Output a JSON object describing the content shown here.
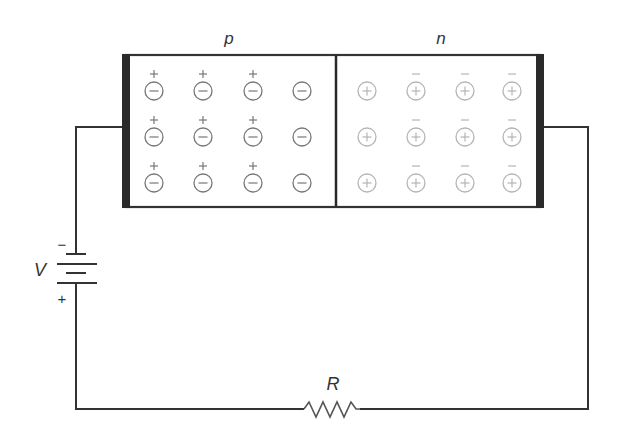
{
  "diagram": {
    "title": "",
    "labels": {
      "p_region": "p",
      "n_region": "n",
      "voltage": "V",
      "resistor": "R",
      "battery_negative": "−",
      "battery_positive": "+"
    },
    "colors": {
      "wire": "#333333",
      "contact": "#2a2a2a",
      "p_ion": "#777777",
      "n_ion": "#b5b5b5"
    },
    "p_region": {
      "ion_type": "acceptor (negative ion)",
      "ion_symbol": "−",
      "carrier_symbol": "+",
      "ion_columns_x": [
        154,
        203,
        253,
        302
      ],
      "ion_rows_y": [
        91,
        137,
        183
      ],
      "carriers_present_columns": [
        0,
        1,
        2
      ]
    },
    "n_region": {
      "ion_type": "donor (positive ion)",
      "ion_symbol": "+",
      "carrier_symbol": "−",
      "ion_columns_x": [
        367,
        416,
        465,
        512
      ],
      "ion_rows_y": [
        91,
        137,
        183
      ],
      "carriers_present_columns": [
        1,
        2,
        3
      ]
    },
    "circuit": {
      "battery": "V",
      "resistor": "R"
    }
  }
}
